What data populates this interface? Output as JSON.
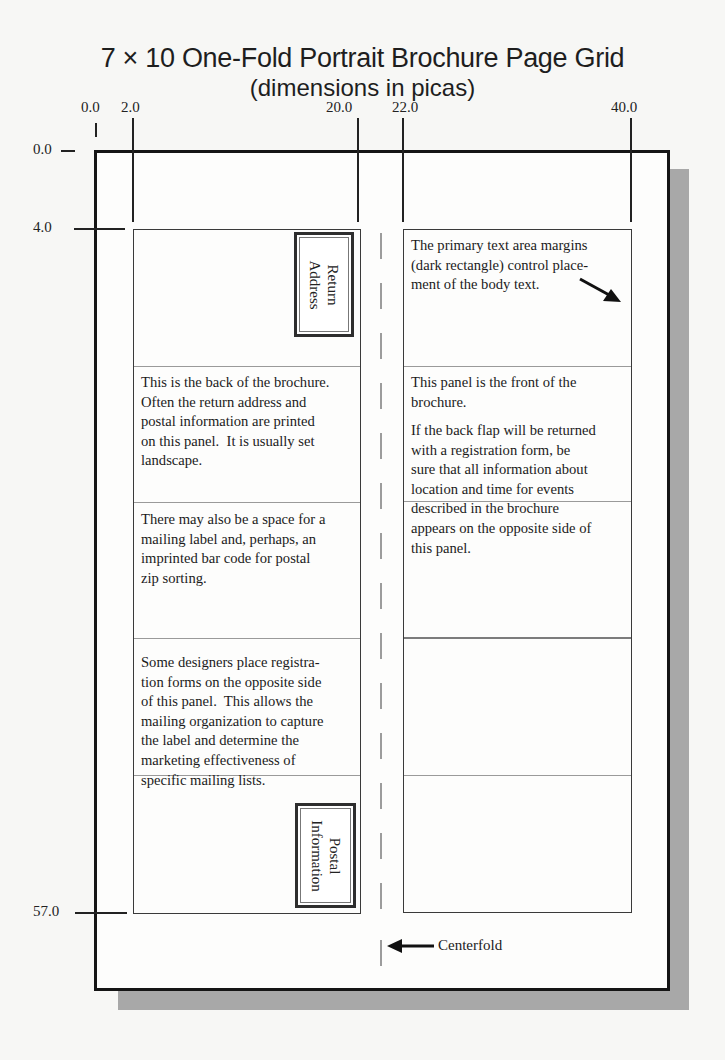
{
  "title": "7 × 10 One-Fold Portrait Brochure Page Grid",
  "subtitle": "(dimensions in picas)",
  "x_ticks": [
    {
      "label": "0.0",
      "x": 95
    },
    {
      "label": "2.0",
      "x": 132
    },
    {
      "label": "20.0",
      "x": 357
    },
    {
      "label": "22.0",
      "x": 402
    },
    {
      "label": "40.0",
      "x": 630
    }
  ],
  "y_ticks": [
    {
      "label": "0.0",
      "y": 151
    },
    {
      "label": "4.0",
      "y": 229
    },
    {
      "label": "57.0",
      "y": 913
    }
  ],
  "panels": {
    "left": {
      "return_address_label": "Return\nAddress",
      "back_text": "This is the back of the brochure.\nOften the return address and\npostal information are printed\non this panel.  It is usually set\nlandscape.",
      "mailing_text": "There may also be a space for a\nmailing label and, perhaps, an\nimprinted bar code for postal\nzip sorting.",
      "registration_text": "Some designers place registra-\ntion forms on the opposite side\nof this panel.  This allows the\nmailing organization to capture\nthe label and determine the\nmarketing effectiveness of\nspecific mailing lists.",
      "postal_info_label": "Postal\nInformation"
    },
    "right": {
      "margins_text": "The primary text area margins\n(dark rectangle) control place-\nment of the body text.",
      "front_text": "This panel is the front of the\nbrochure.",
      "flap_text": "If the back flap will be returned\nwith a registration form, be\nsure that all information about\nlocation and time for events\ndescribed in the brochure\nappears on the opposite side of\nthis panel."
    }
  },
  "centerfold_label": "Centerfold",
  "colors": {
    "outline": "#151515",
    "shadow": "#a8a8a8",
    "divider": "#9a9a9a",
    "fold_dash": "#9c9c9c"
  }
}
